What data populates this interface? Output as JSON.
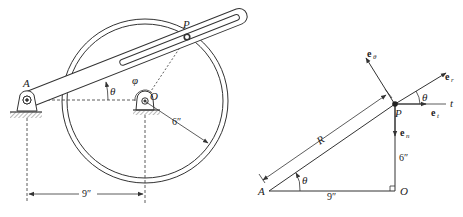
{
  "left_figure": {
    "labels": {
      "pivot_a": "A",
      "pivot_o": "O",
      "point_p": "P",
      "angle_theta": "θ",
      "angle_phi": "φ",
      "radius_dim": "6″",
      "distance_dim": "9″"
    }
  },
  "right_figure": {
    "labels": {
      "point_a": "A",
      "point_o": "O",
      "point_p": "P",
      "length_r": "R",
      "angle_theta_bottom": "θ",
      "angle_theta_top": "θ",
      "dim_vertical": "6″",
      "dim_horizontal": "9″",
      "tangent_axis": "t"
    },
    "unit_vectors": {
      "e_theta": {
        "base": "e",
        "sub": "θ"
      },
      "e_r": {
        "base": "e",
        "sub": "r"
      },
      "e_t": {
        "base": "e",
        "sub": "t"
      },
      "e_n": {
        "base": "e",
        "sub": "n"
      }
    }
  },
  "colors": {
    "stroke": "#333333",
    "background": "#ffffff"
  }
}
